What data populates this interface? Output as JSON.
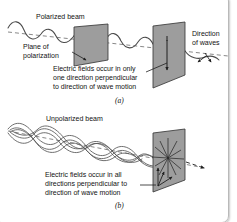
{
  "figure": {
    "colors": {
      "plane_fill": "#9d9d9d",
      "plane_stroke": "#3a3a3a",
      "wave_stroke": "#4a4a4a",
      "axis_dash": "#6a6a6a",
      "text": "#121212",
      "background": "#ffffff",
      "frame": "#b9b9b9"
    },
    "panel_a": {
      "id_label": "(a)",
      "beam_label": "Polarized beam",
      "plane_label_line1": "Plane of",
      "plane_label_line2": "polarization",
      "direction_label_line1": "Direction",
      "direction_label_line2": "of waves",
      "caption_line1": "Electric fields occur in only",
      "caption_line2": "one direction perpendicular",
      "caption_line3": "to direction of wave motion"
    },
    "panel_b": {
      "id_label": "(b)",
      "beam_label": "Unpolarized beam",
      "caption_line1": "Electric fields occur in all",
      "caption_line2": "directions perpendicular to",
      "caption_line3": "direction of wave motion"
    }
  }
}
